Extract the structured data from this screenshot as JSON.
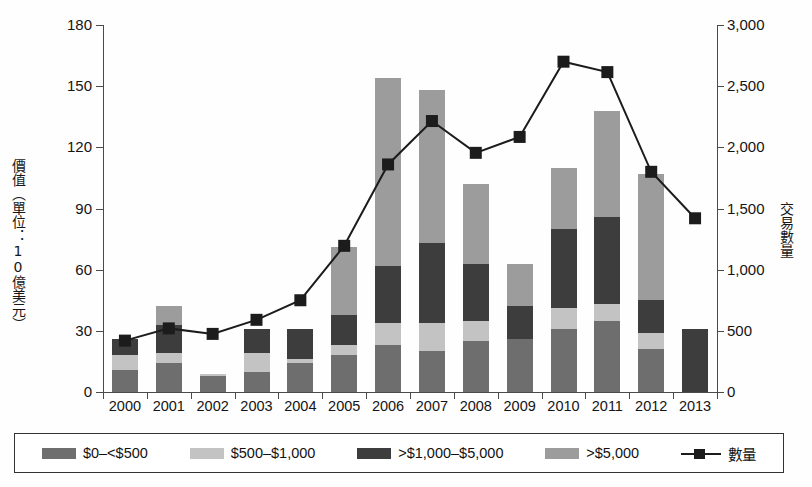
{
  "chart_data": {
    "type": "bar",
    "title": "",
    "subtitle": "",
    "xlabel": "",
    "ylabel": "價值（單位：10億美元）",
    "ylabel_secondary": "交易數量",
    "categories": [
      "2000",
      "2001",
      "2002",
      "2003",
      "2004",
      "2005",
      "2006",
      "2007",
      "2008",
      "2009",
      "2010",
      "2011",
      "2012",
      "2013"
    ],
    "ylim": [
      0,
      180
    ],
    "yticks": [
      "0",
      "30",
      "60",
      "90",
      "120",
      "150",
      "180"
    ],
    "ytick_values": [
      0,
      30,
      60,
      90,
      120,
      150,
      180
    ],
    "ylim_secondary": [
      0,
      3000
    ],
    "yticks_secondary": [
      "0",
      "500",
      "1,000",
      "1,500",
      "2,000",
      "2,500",
      "3,000"
    ],
    "ytick_values_secondary": [
      0,
      500,
      1000,
      1500,
      2000,
      2500,
      3000
    ],
    "grid": false,
    "legend_position": "bottom",
    "stacked": true,
    "series": [
      {
        "name": "$0–<$500",
        "color": "#6e6e6e",
        "values": [
          11,
          14,
          8,
          10,
          14,
          18,
          23,
          20,
          25,
          26,
          31,
          35,
          21,
          0
        ]
      },
      {
        "name": "$500–$1,000",
        "color": "#c3c3c3",
        "values": [
          7,
          5,
          1,
          9,
          2,
          5,
          11,
          14,
          10,
          0,
          10,
          8,
          8,
          0
        ]
      },
      {
        "name": ">$1,000–$5,000",
        "color": "#3d3d3d",
        "values": [
          8,
          14,
          0,
          12,
          15,
          15,
          28,
          39,
          28,
          16,
          39,
          43,
          16,
          31
        ]
      },
      {
        "name": ">$5,000",
        "color": "#9c9c9c",
        "values": [
          0,
          9,
          0,
          0,
          0,
          33,
          92,
          75,
          39,
          21,
          30,
          52,
          62,
          0
        ]
      }
    ],
    "line_series": {
      "name": "數量",
      "color": "#1c1c1c",
      "marker": "square",
      "axis": "secondary",
      "values": [
        420,
        520,
        475,
        590,
        750,
        1195,
        1860,
        2215,
        1955,
        2085,
        2700,
        2615,
        1800,
        1420
      ]
    }
  },
  "legend": {
    "entries": [
      {
        "label": "$0–<$500",
        "swatch": "#6e6e6e",
        "kind": "swatch"
      },
      {
        "label": "$500–$1,000",
        "swatch": "#c3c3c3",
        "kind": "swatch"
      },
      {
        "label": ">$1,000–$5,000",
        "swatch": "#3d3d3d",
        "kind": "swatch"
      },
      {
        "label": ">$5,000",
        "swatch": "#9c9c9c",
        "kind": "swatch"
      },
      {
        "label": "數量",
        "swatch": "#1c1c1c",
        "kind": "line-marker"
      }
    ]
  }
}
